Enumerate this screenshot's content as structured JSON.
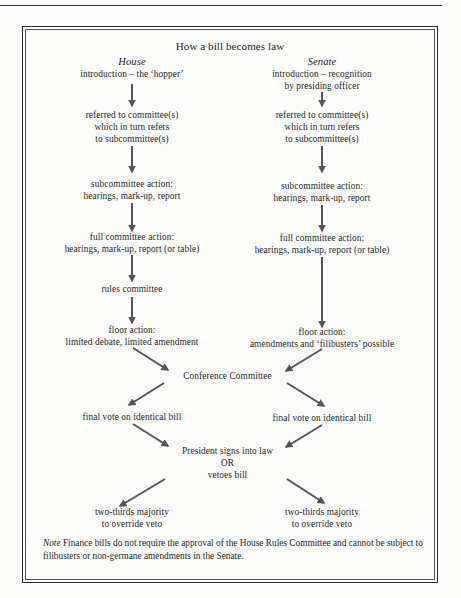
{
  "title": "How a bill becomes law",
  "columns": {
    "house": {
      "heading": "House",
      "steps": [
        "introduction – the ‘hopper’",
        "referred to committee(s)\nwhich in turn refers\nto subcommittee(s)",
        "subcommittee action:\nhearings, mark-up, report",
        "full committee action:\nhearings, mark-up, report (or table)",
        "rules committee",
        "floor action:\nlimited debate, limited amendment"
      ]
    },
    "senate": {
      "heading": "Senate",
      "steps": [
        "introduction – recognition\nby presiding officer",
        "referred to committee(s)\nwhich in turn refers\nto subcommittee(s)",
        "subcommittee action:\nhearings, mark-up, report",
        "full committee action:\nhearings, mark-up, report (or table)",
        "floor action:\namendments and ‘filibusters’ possible"
      ]
    }
  },
  "merge": {
    "conference": "Conference Committee",
    "final_vote_house": "final vote on identical bill",
    "final_vote_senate": "final vote on identical bill",
    "president": "President signs into law\nOR\nvetoes bill",
    "override_house": "two-thirds majority\nto override veto",
    "override_senate": "two-thirds majority\nto override veto"
  },
  "note": {
    "label": "Note",
    "text": " Finance bills do not require the approval of the House Rules Committee and cannot be subject to filibusters or non-germane amendments in the Senate."
  },
  "colors": {
    "arrow": "#555555",
    "text": "#1e1e1e",
    "border": "#2a2a2a"
  }
}
